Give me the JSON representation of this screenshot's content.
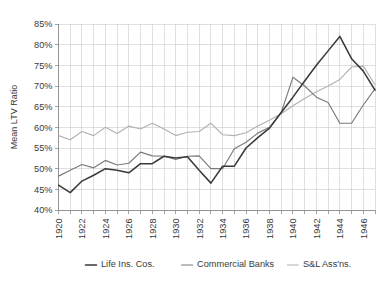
{
  "chart_data": {
    "type": "line",
    "title": "",
    "xlabel": "",
    "ylabel": "Mean LTV Ratio",
    "xlim": [
      1920,
      1947
    ],
    "ylim": [
      40,
      85
    ],
    "ytick_labels": [
      "40%",
      "45%",
      "50%",
      "55%",
      "60%",
      "65%",
      "70%",
      "75%",
      "80%",
      "85%"
    ],
    "ytick_values": [
      40,
      45,
      50,
      55,
      60,
      65,
      70,
      75,
      80,
      85
    ],
    "xtick_labels": [
      "1920",
      "1922",
      "1924",
      "1926",
      "1928",
      "1930",
      "1932",
      "1934",
      "1936",
      "1938",
      "1940",
      "1942",
      "1944",
      "1946"
    ],
    "xtick_values": [
      1920,
      1922,
      1924,
      1926,
      1928,
      1930,
      1932,
      1934,
      1936,
      1938,
      1940,
      1942,
      1944,
      1946
    ],
    "x": [
      1920,
      1921,
      1922,
      1923,
      1924,
      1925,
      1926,
      1927,
      1928,
      1929,
      1930,
      1931,
      1932,
      1933,
      1934,
      1935,
      1936,
      1937,
      1938,
      1939,
      1940,
      1941,
      1942,
      1943,
      1944,
      1945,
      1946,
      1947
    ],
    "grid": true,
    "legend_position": "bottom",
    "series": [
      {
        "name": "Life Ins. Cos.",
        "color": "#3a3a3a",
        "values": [
          46.0,
          44.2,
          47.0,
          48.4,
          50.0,
          49.6,
          49.0,
          51.2,
          51.2,
          53.0,
          52.6,
          52.9,
          49.6,
          46.5,
          50.6,
          50.6,
          55.0,
          57.5,
          59.8,
          63.6,
          67.3,
          71.2,
          75.0,
          78.5,
          82.0,
          76.6,
          73.6,
          69.0
        ]
      },
      {
        "name": "Commercial Banks",
        "color": "#7a7a7a",
        "values": [
          48.2,
          49.6,
          51.0,
          50.2,
          52.0,
          50.9,
          51.3,
          54.0,
          53.1,
          53.0,
          52.2,
          53.0,
          53.1,
          50.0,
          50.0,
          54.8,
          56.4,
          58.6,
          60.0,
          63.6,
          72.1,
          70.0,
          67.3,
          66.0,
          61.0,
          61.0,
          65.4,
          69.3
        ]
      },
      {
        "name": "S&L Ass'ns.",
        "color": "#b2b2b2",
        "values": [
          58.0,
          57.0,
          59.0,
          58.0,
          60.0,
          58.5,
          60.3,
          59.6,
          61.0,
          59.6,
          58.0,
          58.8,
          59.0,
          61.0,
          58.2,
          58.0,
          58.7,
          60.3,
          61.7,
          63.3,
          65.2,
          67.0,
          68.6,
          70.0,
          71.6,
          74.6,
          74.8,
          70.3
        ]
      }
    ]
  },
  "legend": {
    "items": [
      {
        "label": "Life Ins. Cos.",
        "color": "#3a3a3a"
      },
      {
        "label": "Commercial Banks",
        "color": "#7a7a7a"
      },
      {
        "label": "S&L Ass'ns.",
        "color": "#b2b2b2"
      }
    ]
  }
}
